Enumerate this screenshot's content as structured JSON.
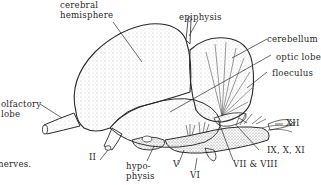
{
  "diagram": {
    "labels": {
      "cerebral_hemisphere": "cerebral\nhemisphere",
      "epiphysis": "epiphysis",
      "cerebellum": "cerebellum",
      "optic_lobe": "optic lobe",
      "floeculus": "floeculus",
      "olfactory_lobe": "olfactory\nlobe",
      "nerve_II": "II",
      "hypophysis": "hypo-\nphysis",
      "nerve_V": "V",
      "nerve_VI": "VI",
      "nerves_VII_VIII": "VII & VIII",
      "nerves_IX_X_XI": "IX, X, XI",
      "nerve_XII": "XII",
      "caption_fragment": "nerves."
    },
    "colors": {
      "ink": "#2a2a2a",
      "stipple": "#9a9a9a",
      "background": "#ffffff"
    }
  }
}
